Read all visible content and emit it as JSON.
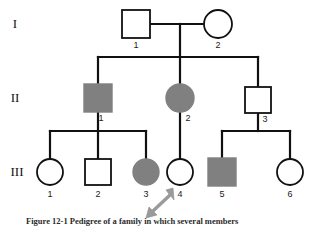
{
  "figure": {
    "type": "pedigree-chart",
    "caption": "Figure 12-1  Pedigree of a family in which several members",
    "generation_labels": [
      {
        "label": "I",
        "y": 24
      },
      {
        "label": "II",
        "y": 98
      },
      {
        "label": "III",
        "y": 172
      }
    ],
    "legend_meaning": {
      "square": "male",
      "circle": "female",
      "filled": "affected",
      "open": "unaffected",
      "arrow": "proband"
    },
    "individuals": [
      {
        "id": "I-1",
        "number": "1",
        "generation": "I",
        "sex": "male",
        "shape": "square",
        "affected": false,
        "x": 136,
        "y": 24,
        "size": 28
      },
      {
        "id": "I-2",
        "number": "2",
        "generation": "I",
        "sex": "female",
        "shape": "circle",
        "affected": false,
        "x": 218,
        "y": 24,
        "size": 28
      },
      {
        "id": "II-1",
        "number": "1",
        "generation": "II",
        "sex": "male",
        "shape": "square",
        "affected": true,
        "x": 98,
        "y": 98,
        "size": 28
      },
      {
        "id": "II-2",
        "number": "2",
        "generation": "II",
        "sex": "female",
        "shape": "circle",
        "affected": true,
        "x": 180,
        "y": 98,
        "size": 28
      },
      {
        "id": "II-3",
        "number": "3",
        "generation": "II",
        "sex": "male",
        "shape": "square",
        "affected": false,
        "x": 258,
        "y": 100,
        "size": 26
      },
      {
        "id": "III-1",
        "number": "1",
        "generation": "III",
        "sex": "female",
        "shape": "circle",
        "affected": false,
        "x": 50,
        "y": 172,
        "size": 26
      },
      {
        "id": "III-2",
        "number": "2",
        "generation": "III",
        "sex": "male",
        "shape": "square",
        "affected": false,
        "x": 98,
        "y": 172,
        "size": 26
      },
      {
        "id": "III-3",
        "number": "3",
        "generation": "III",
        "sex": "female",
        "shape": "circle",
        "affected": true,
        "x": 146,
        "y": 172,
        "size": 26
      },
      {
        "id": "III-4",
        "number": "4",
        "generation": "III",
        "sex": "female",
        "shape": "circle",
        "affected": false,
        "x": 180,
        "y": 172,
        "size": 26
      },
      {
        "id": "III-5",
        "number": "5",
        "generation": "III",
        "sex": "male",
        "shape": "square",
        "affected": true,
        "x": 222,
        "y": 172,
        "size": 28
      },
      {
        "id": "III-6",
        "number": "6",
        "generation": "III",
        "sex": "female",
        "shape": "circle",
        "affected": false,
        "x": 290,
        "y": 172,
        "size": 26
      }
    ],
    "proband": "III-4",
    "colors": {
      "line": "#111111",
      "affected_fill": "#808080",
      "unaffected_fill": "#ffffff",
      "arrow": "#9a9a9a",
      "background": "#ffffff"
    }
  }
}
